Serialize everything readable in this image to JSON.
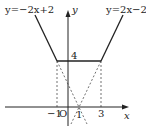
{
  "diagram": {
    "type": "function-graph",
    "axes": {
      "x_label": "x",
      "y_label": "y",
      "origin_label": "O"
    },
    "labels": {
      "left_line": "y=−2x+2",
      "right_line": "y=2x−2",
      "y_tick_4": "4",
      "x_tick_neg1": "−1",
      "x_tick_1": "1",
      "x_tick_3": "3"
    },
    "functions": [
      {
        "name": "left",
        "equation": "y=-2x+2",
        "solid_domain": "x<=-1"
      },
      {
        "name": "flat",
        "equation": "y=4",
        "solid_domain": "-1<=x<=3"
      },
      {
        "name": "right",
        "equation": "y=2x-2",
        "solid_domain": "x>=3"
      }
    ],
    "key_points": [
      [
        -1,
        4
      ],
      [
        3,
        4
      ],
      [
        1,
        0
      ]
    ],
    "colors": {
      "solid": "#222222",
      "dashed": "#333333"
    }
  }
}
